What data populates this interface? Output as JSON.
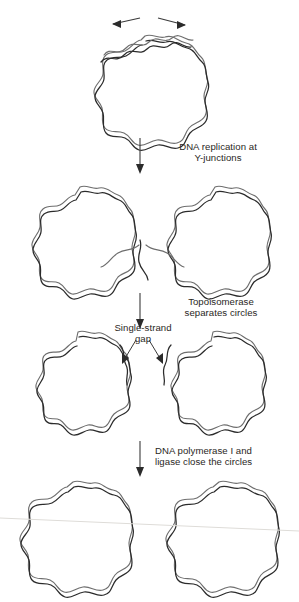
{
  "figure": {
    "width": 299,
    "height": 602,
    "background": "#ffffff",
    "ink_color": "#2b2b2b",
    "text_color": "#2a2724",
    "scanline_color": "#dedcd8"
  },
  "labels": {
    "replication": "DNA replication at\nY-junctions",
    "topoisomerase": "Topoisomerase\nseparates circles",
    "single_strand_gap": "Single-strand\ngap",
    "polymerase": "DNA polymerase I and\nligase close the circles"
  },
  "stages": [
    {
      "id": "stage-1",
      "name": "parental-circle-opening",
      "description": "Single circular double-stranded DNA with strands separating at the top",
      "circles": [
        {
          "cx": 145,
          "cy": 88,
          "r": 50,
          "lobes": 14
        }
      ],
      "arrows": [
        {
          "name": "strand-separation-arrow-left",
          "direction": "up-left"
        },
        {
          "name": "strand-separation-arrow-right",
          "direction": "up-right"
        }
      ]
    },
    {
      "id": "stage-2",
      "name": "catenated-daughter-circles",
      "description": "Two interlocked daughter circles joined at a junction",
      "circles": [
        {
          "cx": 80,
          "cy": 235,
          "r": 48,
          "lobes": 14
        },
        {
          "cx": 215,
          "cy": 235,
          "r": 48,
          "lobes": 14
        }
      ]
    },
    {
      "id": "stage-3",
      "name": "separated-circles-with-gaps",
      "description": "Two separated circles each retaining a single-strand gap",
      "circles": [
        {
          "cx": 78,
          "cy": 377,
          "r": 45,
          "lobes": 14
        },
        {
          "cx": 213,
          "cy": 377,
          "r": 45,
          "lobes": 14
        }
      ],
      "arrows": [
        {
          "name": "gap-pointer-left",
          "direction": "down-left"
        },
        {
          "name": "gap-pointer-right",
          "direction": "down-right"
        }
      ]
    },
    {
      "id": "stage-4",
      "name": "closed-daughter-circles",
      "description": "Two complete covalently closed circular chromosomes",
      "circles": [
        {
          "cx": 73,
          "cy": 534,
          "r": 50,
          "lobes": 14
        },
        {
          "cx": 219,
          "cy": 534,
          "r": 50,
          "lobes": 14
        }
      ]
    }
  ],
  "transitions": [
    {
      "name": "arrow-stage1-to-stage2",
      "x": 140,
      "y1": 138,
      "y2": 173,
      "label": "replication"
    },
    {
      "name": "arrow-stage2-to-stage3",
      "x": 140,
      "y1": 293,
      "y2": 328,
      "label": "topoisomerase"
    },
    {
      "name": "arrow-stage3-to-stage4",
      "x": 140,
      "y1": 441,
      "y2": 476,
      "label": "polymerase"
    }
  ]
}
